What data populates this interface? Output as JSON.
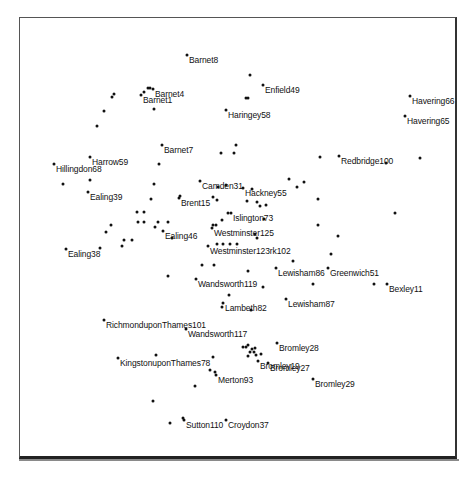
{
  "chart_data": {
    "type": "scatter",
    "title": "",
    "xlabel": "",
    "ylabel": "",
    "grid": false,
    "legend": null,
    "coordinate_system": "pixel positions within 474x478 image",
    "labeled_points": [
      {
        "label": "Barnet8",
        "x": 187,
        "y": 55
      },
      {
        "label": "Barnet4",
        "x": 153,
        "y": 89
      },
      {
        "label": "Barnet1",
        "x": 141,
        "y": 95
      },
      {
        "label": "Enfield49",
        "x": 263,
        "y": 85
      },
      {
        "label": "Havering66",
        "x": 410,
        "y": 96
      },
      {
        "label": "Havering65",
        "x": 405,
        "y": 116
      },
      {
        "label": "Haringey58",
        "x": 226,
        "y": 110
      },
      {
        "label": "Barnet7",
        "x": 162,
        "y": 145
      },
      {
        "label": "Harrow59",
        "x": 90,
        "y": 157
      },
      {
        "label": "Hillingdon68",
        "x": 54,
        "y": 164
      },
      {
        "label": "Redbridge100",
        "x": 339,
        "y": 156
      },
      {
        "label": "Ealing39",
        "x": 88,
        "y": 192
      },
      {
        "label": "Camden31",
        "x": 200,
        "y": 181
      },
      {
        "label": "Hackney55",
        "x": 243,
        "y": 188
      },
      {
        "label": "Brent15",
        "x": 179,
        "y": 198
      },
      {
        "label": "Islington73",
        "x": 231,
        "y": 213
      },
      {
        "label": "Ealing46",
        "x": 163,
        "y": 231
      },
      {
        "label": "Westminster125",
        "x": 212,
        "y": 228
      },
      {
        "label": "Westminster123rk102",
        "x": 208,
        "y": 246
      },
      {
        "label": "Ealing38",
        "x": 66,
        "y": 249
      },
      {
        "label": "Lewisham86",
        "x": 276,
        "y": 268
      },
      {
        "label": "Greenwich51",
        "x": 328,
        "y": 268
      },
      {
        "label": "Bexley11",
        "x": 387,
        "y": 284
      },
      {
        "label": "Wandsworth119",
        "x": 196,
        "y": 279
      },
      {
        "label": "Lambeth82",
        "x": 223,
        "y": 303
      },
      {
        "label": "Lewisham87",
        "x": 286,
        "y": 299
      },
      {
        "label": "RichmonduponThames101",
        "x": 104,
        "y": 320
      },
      {
        "label": "Wandsworth117",
        "x": 186,
        "y": 329
      },
      {
        "label": "Bromley28",
        "x": 277,
        "y": 343
      },
      {
        "label": "KingstonuponThames78",
        "x": 118,
        "y": 358
      },
      {
        "label": "Bromley19",
        "x": 258,
        "y": 361
      },
      {
        "label": "Bromley27",
        "x": 268,
        "y": 363
      },
      {
        "label": "Merton93",
        "x": 216,
        "y": 375
      },
      {
        "label": "Bromley29",
        "x": 313,
        "y": 379
      },
      {
        "label": "Sutton110",
        "x": 184,
        "y": 420
      },
      {
        "label": "Croydon37",
        "x": 226,
        "y": 420
      }
    ],
    "unlabeled_points": [
      [
        148,
        88
      ],
      [
        150,
        88
      ],
      [
        144,
        92
      ],
      [
        154,
        109
      ],
      [
        114,
        94
      ],
      [
        112,
        97
      ],
      [
        104,
        111
      ],
      [
        97,
        126
      ],
      [
        250,
        75
      ],
      [
        246,
        98
      ],
      [
        248,
        98
      ],
      [
        236,
        145
      ],
      [
        234,
        153
      ],
      [
        221,
        153
      ],
      [
        159,
        164
      ],
      [
        90,
        180
      ],
      [
        63,
        184
      ],
      [
        154,
        184
      ],
      [
        151,
        199
      ],
      [
        213,
        197
      ],
      [
        217,
        200
      ],
      [
        180,
        196
      ],
      [
        218,
        187
      ],
      [
        226,
        185
      ],
      [
        247,
        201
      ],
      [
        252,
        189
      ],
      [
        257,
        202
      ],
      [
        260,
        206
      ],
      [
        266,
        205
      ],
      [
        264,
        219
      ],
      [
        289,
        179
      ],
      [
        297,
        187
      ],
      [
        304,
        182
      ],
      [
        320,
        157
      ],
      [
        420,
        158
      ],
      [
        386,
        163
      ],
      [
        318,
        199
      ],
      [
        395,
        213
      ],
      [
        318,
        225
      ],
      [
        338,
        236
      ],
      [
        331,
        254
      ],
      [
        257,
        238
      ],
      [
        255,
        234
      ],
      [
        222,
        220
      ],
      [
        228,
        213
      ],
      [
        213,
        225
      ],
      [
        216,
        225
      ],
      [
        137,
        212
      ],
      [
        144,
        212
      ],
      [
        138,
        222
      ],
      [
        144,
        222
      ],
      [
        155,
        227
      ],
      [
        158,
        222
      ],
      [
        168,
        222
      ],
      [
        172,
        238
      ],
      [
        132,
        240
      ],
      [
        124,
        240
      ],
      [
        111,
        225
      ],
      [
        106,
        232
      ],
      [
        100,
        248
      ],
      [
        122,
        246
      ],
      [
        217,
        244
      ],
      [
        223,
        244
      ],
      [
        230,
        244
      ],
      [
        237,
        244
      ],
      [
        248,
        271
      ],
      [
        293,
        261
      ],
      [
        313,
        284
      ],
      [
        374,
        284
      ],
      [
        168,
        276
      ],
      [
        202,
        265
      ],
      [
        214,
        265
      ],
      [
        263,
        287
      ],
      [
        229,
        295
      ],
      [
        251,
        310
      ],
      [
        222,
        307
      ],
      [
        243,
        347
      ],
      [
        246,
        347
      ],
      [
        248,
        345
      ],
      [
        252,
        349
      ],
      [
        255,
        348
      ],
      [
        250,
        352
      ],
      [
        254,
        352
      ],
      [
        256,
        355
      ],
      [
        261,
        354
      ],
      [
        248,
        356
      ],
      [
        156,
        355
      ],
      [
        213,
        357
      ],
      [
        210,
        370
      ],
      [
        215,
        372
      ],
      [
        195,
        386
      ],
      [
        153,
        401
      ],
      [
        170,
        423
      ],
      [
        183,
        418
      ]
    ]
  }
}
